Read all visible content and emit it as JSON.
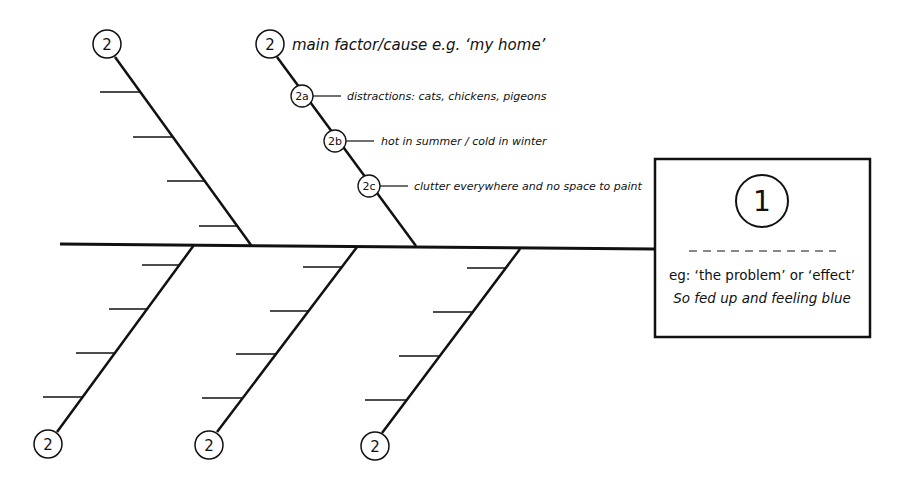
{
  "diagram": {
    "type": "fishbone (Ishikawa) cause-and-effect diagram",
    "colors": {
      "line": "#111111",
      "background": "#ffffff"
    },
    "spine": {
      "x1": 60,
      "y1": 244,
      "x2": 654,
      "y2": 249
    },
    "effect_box": {
      "number": "1",
      "line1": "eg: ‘the problem’ or ‘effect’",
      "line2": "So fed up and feeling blue"
    },
    "bones": [
      {
        "id": "upper-left",
        "label": "2",
        "position": "top",
        "ticks": 4
      },
      {
        "id": "upper-right",
        "label": "2",
        "position": "top",
        "annotation": "main factor/cause e.g. ‘my home’",
        "sub_causes": [
          {
            "label": "2a",
            "text": "distractions: cats, chickens, pigeons"
          },
          {
            "label": "2b",
            "text": "hot in summer / cold in winter"
          },
          {
            "label": "2c",
            "text": "clutter everywhere and no space to paint"
          }
        ]
      },
      {
        "id": "lower-left",
        "label": "2",
        "position": "bottom",
        "ticks": 4
      },
      {
        "id": "lower-middle",
        "label": "2",
        "position": "bottom",
        "ticks": 4
      },
      {
        "id": "lower-right",
        "label": "2",
        "position": "bottom",
        "ticks": 4
      }
    ]
  }
}
